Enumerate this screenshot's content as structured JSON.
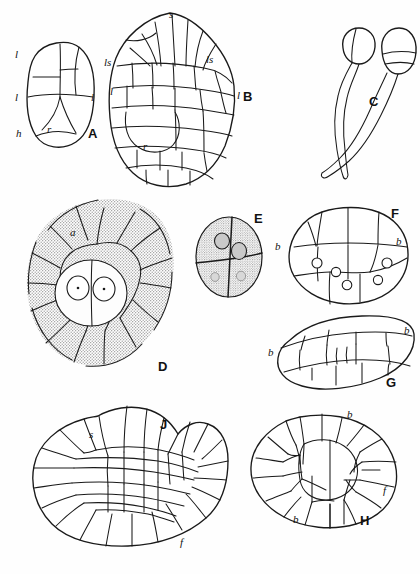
{
  "plate": {
    "title": "Comparative embryo and spore development plate",
    "background_color": "#fefefe",
    "ink_color": "#1a1a1a",
    "stipple_color": "#9a9a9a",
    "width": 420,
    "height": 574
  },
  "figures": [
    {
      "id": "A",
      "letter": "A",
      "caption_position": {
        "x": 88,
        "y": 133
      },
      "description": "Young embryo in median longitudinal section, oval, few cells",
      "labels": [
        {
          "text": "l",
          "x": 15,
          "y": 58
        },
        {
          "text": "l",
          "x": 15,
          "y": 97
        },
        {
          "text": "l",
          "x": 90,
          "y": 97
        },
        {
          "text": "h",
          "x": 17,
          "y": 135
        },
        {
          "text": "r",
          "x": 48,
          "y": 131
        }
      ]
    },
    {
      "id": "B",
      "letter": "B",
      "caption_position": {
        "x": 238,
        "y": 97
      },
      "description": "Older embryo, many-celled, shoot apex and root region differentiated",
      "labels": [
        {
          "text": "s",
          "x": 172,
          "y": 16
        },
        {
          "text": "ls",
          "x": 108,
          "y": 62
        },
        {
          "text": "ls",
          "x": 210,
          "y": 60
        },
        {
          "text": "l",
          "x": 111,
          "y": 91
        },
        {
          "text": "l",
          "x": 238,
          "y": 96
        },
        {
          "text": "r",
          "x": 146,
          "y": 146
        }
      ]
    },
    {
      "id": "C",
      "letter": "C",
      "caption_position": {
        "x": 374,
        "y": 101
      },
      "description": "Two spermatozoids with swollen anterior body and long flagellar tail",
      "labels": []
    },
    {
      "id": "D",
      "letter": "D",
      "caption_position": {
        "x": 163,
        "y": 366
      },
      "description": "Surface view of young embryo sac showing two nuclei in central clear cell, stippled cytoplasm",
      "labels": [
        {
          "text": "a",
          "x": 74,
          "y": 231
        }
      ]
    },
    {
      "id": "E",
      "letter": "E",
      "caption_position": {
        "x": 258,
        "y": 218
      },
      "description": "Four-celled stage seen in optical section, two large nuclei and two small nuclei",
      "labels": []
    },
    {
      "id": "F",
      "letter": "F",
      "caption_position": {
        "x": 396,
        "y": 213
      },
      "description": "Embryo in surface view showing basal cells and scattered nuclei",
      "labels": [
        {
          "text": "b",
          "x": 278,
          "y": 246
        },
        {
          "text": "b",
          "x": 393,
          "y": 241
        }
      ]
    },
    {
      "id": "G",
      "letter": "G",
      "caption_position": {
        "x": 391,
        "y": 382
      },
      "description": "Elongated embryo, lateral view, basal cells at each end",
      "labels": [
        {
          "text": "b",
          "x": 271,
          "y": 352
        },
        {
          "text": "b",
          "x": 404,
          "y": 330
        }
      ]
    },
    {
      "id": "H",
      "letter": "H",
      "caption_position": {
        "x": 365,
        "y": 521
      },
      "description": "Mature embryo, oval, with foot and basal cell regions",
      "labels": [
        {
          "text": "b",
          "x": 350,
          "y": 414
        },
        {
          "text": "b",
          "x": 297,
          "y": 519
        },
        {
          "text": "f",
          "x": 384,
          "y": 490
        }
      ]
    },
    {
      "id": "J",
      "letter": "J",
      "caption_position": {
        "x": 164,
        "y": 424
      },
      "description": "Embryo with prominent shoot apex and foot, many segmented cells",
      "labels": [
        {
          "text": "s",
          "x": 94,
          "y": 432
        },
        {
          "text": "f",
          "x": 183,
          "y": 541
        }
      ]
    }
  ],
  "legend_keys": [
    {
      "symbol": "s",
      "meaning": "shoot apex"
    },
    {
      "symbol": "ls",
      "meaning": "leaf initial / lateral segment"
    },
    {
      "symbol": "l",
      "meaning": "leaf"
    },
    {
      "symbol": "r",
      "meaning": "root"
    },
    {
      "symbol": "h",
      "meaning": "haustorium"
    },
    {
      "symbol": "a",
      "meaning": "archegonium wall"
    },
    {
      "symbol": "b",
      "meaning": "basal cell"
    },
    {
      "symbol": "f",
      "meaning": "foot"
    }
  ]
}
